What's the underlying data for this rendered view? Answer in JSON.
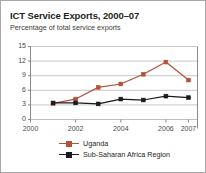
{
  "figure": {
    "title": "ICT Service Exports, 2000–07",
    "subtitle": "Percentage of total service exports",
    "border_color": "#a8a8a8",
    "background": "#ffffff"
  },
  "chart_data": {
    "type": "line",
    "title": "ICT Service Exports, 2000–07",
    "subtitle": "Percentage of total service exports",
    "xlabel": "",
    "ylabel": "",
    "x": [
      2001,
      2002,
      2003,
      2004,
      2005,
      2006,
      2007
    ],
    "xlim": [
      2000,
      2007.4
    ],
    "ylim": [
      0,
      15
    ],
    "yticks": [
      0,
      3,
      6,
      9,
      12,
      15
    ],
    "xticks": [
      2000,
      2002,
      2004,
      2006,
      2007
    ],
    "xtick_labels": [
      "2000",
      "2002",
      "2004",
      "2006",
      "2007"
    ],
    "ytick_labels": [
      "0",
      "3",
      "6",
      "9",
      "12",
      "15"
    ],
    "grid": "horizontal",
    "grid_color": "#b9b9b9",
    "legend_position": "bottom",
    "series": [
      {
        "name": "Uganda",
        "color": "#b4513a",
        "marker": "square",
        "values": [
          3.3,
          4.2,
          6.6,
          7.3,
          9.3,
          11.8,
          8.1
        ]
      },
      {
        "name": "Sub-Saharan Africa Region",
        "color": "#1a1a1a",
        "marker": "square",
        "values": [
          3.4,
          3.4,
          3.2,
          4.2,
          4.0,
          4.8,
          4.5
        ]
      }
    ]
  }
}
